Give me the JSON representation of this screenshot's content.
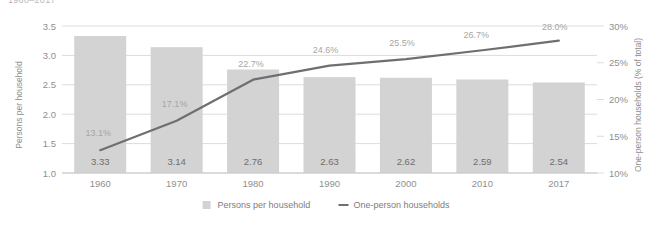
{
  "header": {
    "clipped_title": "1960–2017"
  },
  "chart_data": {
    "type": "bar",
    "title": "1960–2017",
    "categories": [
      "1960",
      "1970",
      "1980",
      "1990",
      "2000",
      "2010",
      "2017"
    ],
    "xlabel": "",
    "ylabel": "Persons per household",
    "ylabel_right": "One-person households (% of total)",
    "ylim": [
      1.0,
      3.5
    ],
    "ylim_right": [
      10,
      30
    ],
    "yticks": [
      "1.0",
      "1.5",
      "2.0",
      "2.5",
      "3.0",
      "3.5"
    ],
    "ytick_values": [
      1.0,
      1.5,
      2.0,
      2.5,
      3.0,
      3.5
    ],
    "yticks_right": [
      "10%",
      "15%",
      "20%",
      "25%",
      "30%"
    ],
    "ytick_values_right": [
      10,
      15,
      20,
      25,
      30
    ],
    "grid": true,
    "legend_position": "bottom",
    "series": [
      {
        "name": "Persons per household",
        "type": "bar",
        "axis": "left",
        "color": "#d3d3d3",
        "values": [
          3.33,
          3.14,
          2.76,
          2.63,
          2.62,
          2.59,
          2.54
        ],
        "labels": [
          "3.33",
          "3.14",
          "2.76",
          "2.63",
          "2.62",
          "2.59",
          "2.54"
        ]
      },
      {
        "name": "One-person households",
        "type": "line",
        "axis": "right",
        "color": "#6f6f6f",
        "values": [
          13.1,
          17.1,
          22.7,
          24.6,
          25.5,
          26.7,
          28.0
        ],
        "labels": [
          "13.1%",
          "17.1%",
          "22.7%",
          "24.6%",
          "25.5%",
          "26.7%",
          "28.0%"
        ]
      }
    ],
    "legend": [
      {
        "label": "Persons per household",
        "marker": "square",
        "color": "#d3d3d3"
      },
      {
        "label": "One-person households",
        "marker": "line",
        "color": "#6f6f6f"
      }
    ]
  },
  "colors": {
    "bar": "#d3d3d3",
    "line": "#6f6f6f",
    "grid": "#dcdcdc",
    "axis_text": "#8f8f8f"
  }
}
